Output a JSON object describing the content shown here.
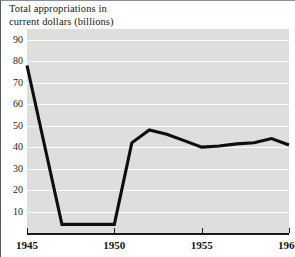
{
  "chart_data": {
    "type": "line",
    "title": "Total appropriations in current dollars (billions)",
    "title_lines": [
      "Total appropriations in",
      "current dollars (billions)"
    ],
    "xlabel": "",
    "ylabel": "Total appropriations in current dollars (billions)",
    "x": [
      1945,
      1946,
      1947,
      1948,
      1949,
      1950,
      1951,
      1952,
      1953,
      1954,
      1955,
      1956,
      1957,
      1958,
      1959,
      1960
    ],
    "values": [
      78,
      41,
      4,
      4,
      4,
      4,
      42,
      48,
      46,
      43,
      40,
      40.5,
      41.5,
      42,
      44,
      41
    ],
    "series": [
      {
        "name": "Total appropriations",
        "values": [
          78,
          41,
          4,
          4,
          4,
          4,
          42,
          48,
          46,
          43,
          40,
          40.5,
          41.5,
          42,
          44,
          41
        ]
      }
    ],
    "xlim": [
      1945,
      1960
    ],
    "ylim": [
      0,
      95
    ],
    "yticks": [
      90,
      80,
      70,
      60,
      50,
      40,
      30,
      20,
      10
    ],
    "ytick_labels": [
      "90",
      "80",
      "70",
      "60",
      "50",
      "40",
      "30",
      "20",
      "10"
    ],
    "xticks": [
      1945,
      1950,
      1955,
      1960
    ],
    "xtick_labels": [
      "1945",
      "1950",
      "1955",
      "1960"
    ],
    "grid": true,
    "grid_color": "#fbfbfa",
    "legend": "none",
    "line_color": "#0d0e0f",
    "plot_background": "#dededd"
  }
}
